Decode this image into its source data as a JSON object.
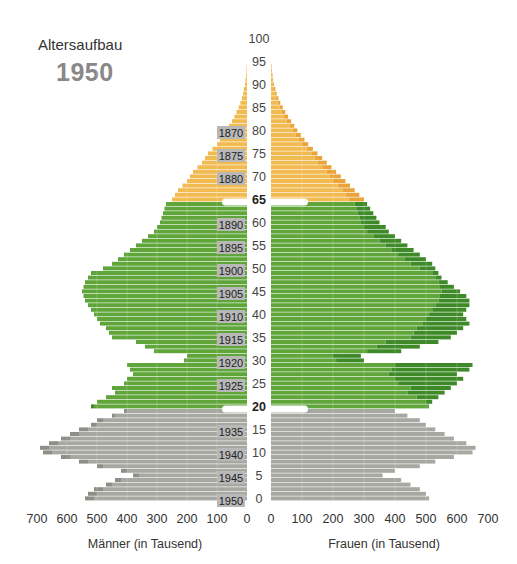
{
  "header": {
    "title": "Altersaufbau",
    "year": "1950"
  },
  "colors": {
    "old_common": "#f2bb52",
    "old_surplus": "#eaa53a",
    "working_common": "#5fa53a",
    "working_surplus": "#3f8a28",
    "young_common": "#a8a8a2",
    "young_surplus": "#8e8e88",
    "cohort_box": "#b8b8b8",
    "divider": "#ffffff"
  },
  "chart_data": {
    "type": "bar",
    "subtype": "population-pyramid",
    "xlabel_left": "Männer (in Tausend)",
    "xlabel_right": "Frauen (in Tausend)",
    "ylabel": "Alter",
    "x_ticks": [
      0,
      100,
      200,
      300,
      400,
      500,
      600,
      700
    ],
    "xlim": [
      0,
      700
    ],
    "y_ticks": [
      0,
      5,
      10,
      15,
      20,
      25,
      30,
      35,
      40,
      45,
      50,
      55,
      60,
      65,
      70,
      75,
      80,
      85,
      90,
      95,
      100
    ],
    "y_ticks_bold": [
      20,
      65
    ],
    "ylim": [
      0,
      100
    ],
    "age_groups": [
      {
        "name": "unter 20",
        "from": 0,
        "to": 19,
        "color": "gray"
      },
      {
        "name": "20 bis 64",
        "from": 20,
        "to": 64,
        "color": "green"
      },
      {
        "name": "65 und älter",
        "from": 65,
        "to": 100,
        "color": "yellow"
      }
    ],
    "cohort_labels": [
      {
        "age": 80,
        "label": "1870"
      },
      {
        "age": 75,
        "label": "1875"
      },
      {
        "age": 70,
        "label": "1880"
      },
      {
        "age": 60,
        "label": "1890"
      },
      {
        "age": 55,
        "label": "1895"
      },
      {
        "age": 50,
        "label": "1900"
      },
      {
        "age": 45,
        "label": "1905"
      },
      {
        "age": 40,
        "label": "1910"
      },
      {
        "age": 35,
        "label": "1915"
      },
      {
        "age": 30,
        "label": "1920"
      },
      {
        "age": 25,
        "label": "1925"
      },
      {
        "age": 15,
        "label": "1935"
      },
      {
        "age": 10,
        "label": "1940"
      },
      {
        "age": 5,
        "label": "1945"
      },
      {
        "age": 0,
        "label": "1950"
      }
    ],
    "ages": [
      0,
      1,
      2,
      3,
      4,
      5,
      6,
      7,
      8,
      9,
      10,
      11,
      12,
      13,
      14,
      15,
      16,
      17,
      18,
      19,
      20,
      21,
      22,
      23,
      24,
      25,
      26,
      27,
      28,
      29,
      30,
      31,
      32,
      33,
      34,
      35,
      36,
      37,
      38,
      39,
      40,
      41,
      42,
      43,
      44,
      45,
      46,
      47,
      48,
      49,
      50,
      51,
      52,
      53,
      54,
      55,
      56,
      57,
      58,
      59,
      60,
      61,
      62,
      63,
      64,
      65,
      66,
      67,
      68,
      69,
      70,
      71,
      72,
      73,
      74,
      75,
      76,
      77,
      78,
      79,
      80,
      81,
      82,
      83,
      84,
      85,
      86,
      87,
      88,
      89,
      90,
      91,
      92,
      93,
      94
    ],
    "series": [
      {
        "name": "Männer",
        "values": [
          540,
          530,
          510,
          470,
          440,
          380,
          420,
          500,
          560,
          620,
          680,
          690,
          660,
          620,
          590,
          560,
          520,
          500,
          450,
          410,
          520,
          500,
          470,
          440,
          450,
          410,
          400,
          380,
          390,
          400,
          210,
          200,
          310,
          340,
          370,
          450,
          460,
          470,
          490,
          500,
          510,
          520,
          530,
          540,
          545,
          550,
          545,
          540,
          530,
          520,
          480,
          450,
          430,
          410,
          390,
          370,
          350,
          330,
          310,
          300,
          290,
          285,
          280,
          275,
          270,
          250,
          240,
          230,
          215,
          200,
          190,
          180,
          165,
          150,
          140,
          130,
          115,
          100,
          90,
          80,
          70,
          60,
          50,
          42,
          35,
          28,
          22,
          17,
          13,
          10,
          7,
          5,
          3,
          2,
          1
        ]
      },
      {
        "name": "Frauen",
        "values": [
          510,
          500,
          480,
          450,
          420,
          360,
          400,
          480,
          530,
          590,
          650,
          660,
          630,
          590,
          560,
          530,
          500,
          480,
          440,
          400,
          510,
          520,
          540,
          560,
          580,
          600,
          620,
          600,
          640,
          650,
          300,
          290,
          420,
          480,
          540,
          580,
          600,
          620,
          640,
          630,
          620,
          630,
          640,
          640,
          630,
          610,
          590,
          570,
          550,
          540,
          530,
          520,
          500,
          480,
          460,
          440,
          420,
          400,
          380,
          370,
          350,
          340,
          330,
          320,
          310,
          300,
          285,
          270,
          255,
          240,
          225,
          210,
          195,
          180,
          165,
          150,
          135,
          120,
          108,
          96,
          85,
          75,
          65,
          55,
          46,
          38,
          30,
          24,
          18,
          14,
          10,
          7,
          5,
          3,
          2
        ]
      }
    ]
  },
  "axis": {
    "left_ticks": [
      "700",
      "600",
      "500",
      "400",
      "300",
      "200",
      "100",
      "0"
    ],
    "right_ticks": [
      "0",
      "100",
      "200",
      "300",
      "400",
      "500",
      "600",
      "700"
    ],
    "left_title": "Männer (in Tausend)",
    "right_title": "Frauen (in Tausend)"
  }
}
